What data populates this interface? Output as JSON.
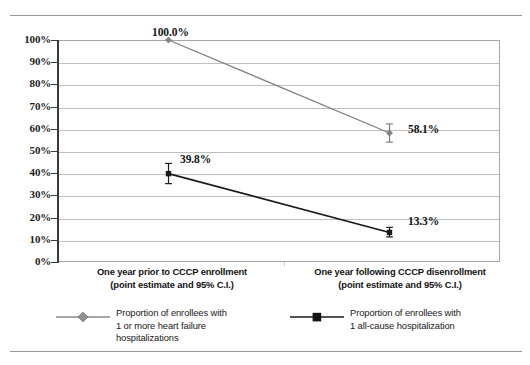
{
  "page": {
    "ghost_header": "",
    "rule_color": "#9a9a9a"
  },
  "chart_data": {
    "type": "line",
    "title": "",
    "subtitle": "",
    "xlabel": "",
    "ylabel": "",
    "ylim": [
      0,
      100
    ],
    "grid": true,
    "legend_position": "bottom",
    "categories": [
      "One year prior to CCCP enrollment\n(point estimate and 95% C.I.)",
      "One year following CCCP disenrollment\n(point estimate and 95% C.I.)"
    ],
    "category_lines": [
      [
        "One year prior to CCCP enrollment",
        "(point estimate and 95% C.I.)"
      ],
      [
        "One year following CCCP disenrollment",
        "(point estimate and 95% C.I.)"
      ]
    ],
    "ytick_labels": [
      "100%",
      "90%",
      "80%",
      "70%",
      "60%",
      "50%",
      "40%",
      "30%",
      "20%",
      "10%",
      "0%"
    ],
    "ytick_values": [
      100,
      90,
      80,
      70,
      60,
      50,
      40,
      30,
      20,
      10,
      0
    ],
    "series": [
      {
        "name": "Proportion of enrollees with\n1 or more heart failure\nhospitalizations",
        "name_lines": [
          "Proportion of enrollees with",
          "1 or more heart failure",
          "hospitalizations"
        ],
        "marker": "diamond",
        "color": "#808080",
        "values": [
          100.0,
          58.1
        ],
        "value_labels": [
          "100.0%",
          "58.1%"
        ],
        "ci_low": [
          100.0,
          54.0
        ],
        "ci_high": [
          100.0,
          62.2
        ]
      },
      {
        "name": "Proportion of enrollees with\n1 all-cause hospitalization",
        "name_lines": [
          "Proportion of enrollees with",
          "1 all-cause hospitalization"
        ],
        "marker": "square",
        "color": "#1a1a1a",
        "values": [
          39.8,
          13.3
        ],
        "value_labels": [
          "39.8%",
          "13.3%"
        ],
        "ci_low": [
          35.3,
          11.3
        ],
        "ci_high": [
          44.4,
          15.6
        ]
      }
    ]
  }
}
